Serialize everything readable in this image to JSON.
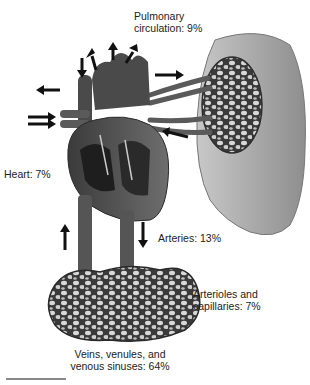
{
  "figure": {
    "labels": {
      "pulmonary": {
        "line1": "Pulmonary",
        "line2": "circulation: 9%"
      },
      "heart": "Heart: 7%",
      "arteries": "Arteries: 13%",
      "arterioles": {
        "line1": "Arterioles and",
        "line2": "capillaries: 7%"
      },
      "veins": {
        "line1": "Veins, venules, and",
        "line2": "venous sinuses: 64%"
      }
    },
    "components": [
      {
        "name": "Pulmonary circulation",
        "percent": 9
      },
      {
        "name": "Heart",
        "percent": 7
      },
      {
        "name": "Arteries",
        "percent": 13
      },
      {
        "name": "Arterioles and capillaries",
        "percent": 7
      },
      {
        "name": "Veins, venules, and venous sinuses",
        "percent": 64
      }
    ],
    "colors": {
      "tissue_dark": "#3a3a3a",
      "tissue_mid": "#6b6b6b",
      "lung": "#a8a8a8",
      "arrow": "#111111"
    }
  }
}
